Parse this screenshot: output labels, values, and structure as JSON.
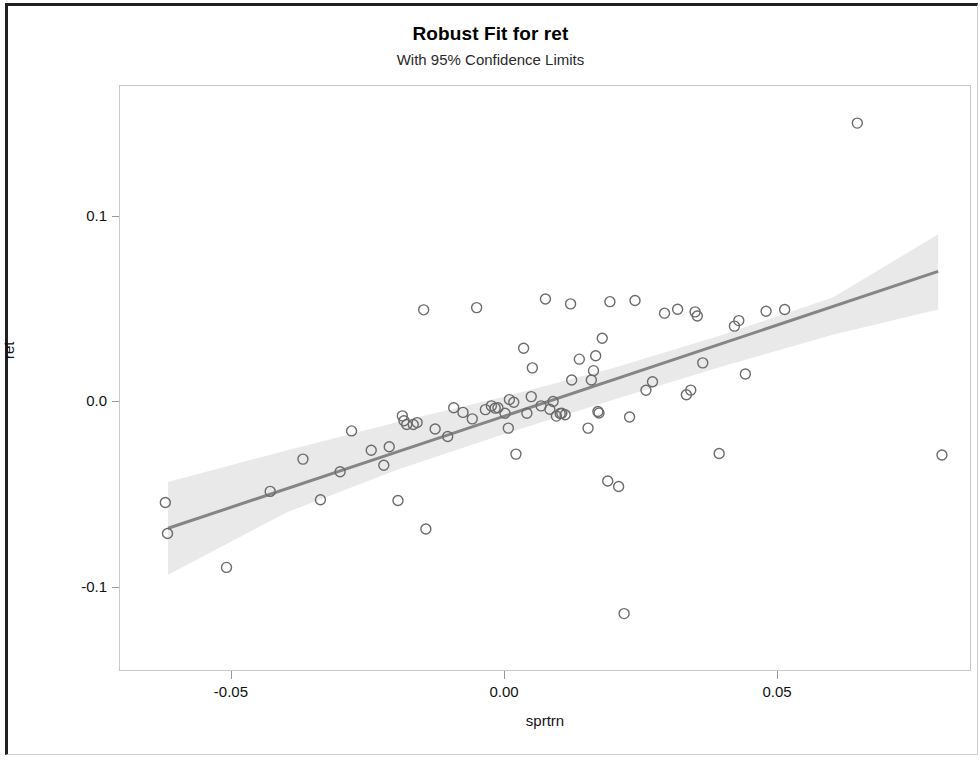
{
  "chart_data": {
    "type": "scatter",
    "title": "Robust Fit for ret",
    "subtitle": "With 95% Confidence Limits",
    "xlabel": "sprtrn",
    "ylabel": "ret",
    "grid": false,
    "legend": null,
    "xlim": [
      -0.0705,
      0.0855
    ],
    "ylim": [
      -0.1455,
      0.1705
    ],
    "xticks": [
      -0.05,
      0.0,
      0.05
    ],
    "xtick_labels": [
      "-0.05",
      "0.00",
      "0.05"
    ],
    "yticks": [
      0.1,
      0.0,
      -0.1
    ],
    "ytick_labels": [
      "0.1",
      "0.0",
      "-0.1"
    ],
    "marker": {
      "shape": "open-circle",
      "radius": 5,
      "edge_color": "#6b6b6b",
      "fill_color": "none",
      "edge_width": 1.4
    },
    "fit_line": {
      "name": "Robust fit",
      "color": "#858585",
      "width": 3,
      "x": [
        -0.0617,
        0.0793
      ],
      "y": [
        -0.068,
        0.0705
      ],
      "slope": 0.982,
      "intercept": -0.00744
    },
    "confidence_band": {
      "name": "95% Confidence Limits",
      "level": 0.95,
      "fill_color": "#e9e9e9",
      "x": [
        -0.0617,
        -0.04,
        -0.02,
        0.0,
        0.02,
        0.04,
        0.06,
        0.0793
      ],
      "lower": [
        -0.093,
        -0.0595,
        -0.0367,
        -0.017,
        0.0014,
        0.0195,
        0.0363,
        0.05
      ],
      "upper": [
        -0.043,
        -0.026,
        -0.011,
        0.003,
        0.0186,
        0.0365,
        0.0565,
        0.0905
      ]
    },
    "points": [
      {
        "x": -0.0622,
        "y": -0.0541
      },
      {
        "x": -0.0618,
        "y": -0.0708
      },
      {
        "x": -0.051,
        "y": -0.0891
      },
      {
        "x": -0.043,
        "y": -0.0481
      },
      {
        "x": -0.037,
        "y": -0.0307
      },
      {
        "x": -0.0338,
        "y": -0.0526
      },
      {
        "x": -0.0302,
        "y": -0.0375
      },
      {
        "x": -0.0281,
        "y": -0.0155
      },
      {
        "x": -0.0245,
        "y": -0.0259
      },
      {
        "x": -0.0222,
        "y": -0.034
      },
      {
        "x": -0.0212,
        "y": -0.024
      },
      {
        "x": -0.0196,
        "y": -0.053
      },
      {
        "x": -0.0188,
        "y": -0.0074
      },
      {
        "x": -0.0185,
        "y": -0.01
      },
      {
        "x": -0.018,
        "y": -0.012
      },
      {
        "x": -0.0168,
        "y": -0.012
      },
      {
        "x": -0.0161,
        "y": -0.011
      },
      {
        "x": -0.0149,
        "y": 0.0498
      },
      {
        "x": -0.0145,
        "y": -0.0684
      },
      {
        "x": -0.0128,
        "y": -0.0145
      },
      {
        "x": -0.0105,
        "y": -0.0185
      },
      {
        "x": -0.0094,
        "y": -0.003
      },
      {
        "x": -0.0077,
        "y": -0.0055
      },
      {
        "x": -0.006,
        "y": -0.009
      },
      {
        "x": -0.0052,
        "y": 0.051
      },
      {
        "x": -0.0036,
        "y": -0.004
      },
      {
        "x": -0.0025,
        "y": -0.002
      },
      {
        "x": -0.0018,
        "y": -0.0032
      },
      {
        "x": -0.0013,
        "y": -0.003
      },
      {
        "x": 0.0,
        "y": -0.006
      },
      {
        "x": 0.0006,
        "y": -0.014
      },
      {
        "x": 0.0008,
        "y": 0.0014
      },
      {
        "x": 0.0016,
        "y": 0.0
      },
      {
        "x": 0.002,
        "y": -0.028
      },
      {
        "x": 0.0034,
        "y": 0.0291
      },
      {
        "x": 0.004,
        "y": -0.006
      },
      {
        "x": 0.0048,
        "y": 0.003
      },
      {
        "x": 0.005,
        "y": 0.0185
      },
      {
        "x": 0.0066,
        "y": -0.002
      },
      {
        "x": 0.0074,
        "y": 0.0556
      },
      {
        "x": 0.0082,
        "y": -0.0038
      },
      {
        "x": 0.0088,
        "y": 0.0004
      },
      {
        "x": 0.0094,
        "y": -0.0075
      },
      {
        "x": 0.0101,
        "y": -0.0061
      },
      {
        "x": 0.0104,
        "y": -0.006
      },
      {
        "x": 0.011,
        "y": -0.0068
      },
      {
        "x": 0.012,
        "y": 0.053
      },
      {
        "x": 0.0122,
        "y": 0.012
      },
      {
        "x": 0.0136,
        "y": 0.0232
      },
      {
        "x": 0.0152,
        "y": -0.014
      },
      {
        "x": 0.0158,
        "y": 0.012
      },
      {
        "x": 0.0162,
        "y": 0.017
      },
      {
        "x": 0.0166,
        "y": 0.025
      },
      {
        "x": 0.017,
        "y": -0.005
      },
      {
        "x": 0.0172,
        "y": -0.0058
      },
      {
        "x": 0.0178,
        "y": 0.0345
      },
      {
        "x": 0.0188,
        "y": -0.0425
      },
      {
        "x": 0.0192,
        "y": 0.0542
      },
      {
        "x": 0.0208,
        "y": -0.0455
      },
      {
        "x": 0.0218,
        "y": -0.114
      },
      {
        "x": 0.0228,
        "y": -0.008
      },
      {
        "x": 0.0238,
        "y": 0.0548
      },
      {
        "x": 0.0258,
        "y": 0.0064
      },
      {
        "x": 0.027,
        "y": 0.011
      },
      {
        "x": 0.0292,
        "y": 0.048
      },
      {
        "x": 0.0316,
        "y": 0.0501
      },
      {
        "x": 0.0332,
        "y": 0.004
      },
      {
        "x": 0.034,
        "y": 0.0065
      },
      {
        "x": 0.0348,
        "y": 0.0487
      },
      {
        "x": 0.0352,
        "y": 0.0465
      },
      {
        "x": 0.0362,
        "y": 0.0212
      },
      {
        "x": 0.0392,
        "y": -0.0277
      },
      {
        "x": 0.042,
        "y": 0.041
      },
      {
        "x": 0.0428,
        "y": 0.044
      },
      {
        "x": 0.044,
        "y": 0.0152
      },
      {
        "x": 0.0478,
        "y": 0.049
      },
      {
        "x": 0.0512,
        "y": 0.05
      },
      {
        "x": 0.0645,
        "y": 0.1505
      },
      {
        "x": 0.08,
        "y": -0.0285
      }
    ]
  },
  "window": {
    "border_color": "#202020"
  }
}
